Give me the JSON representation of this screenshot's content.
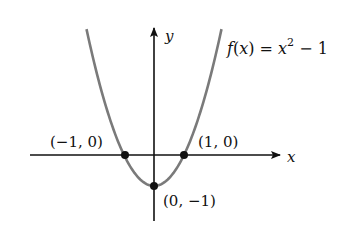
{
  "figure": {
    "function_label": {
      "f": "f",
      "open": "(",
      "var": "x",
      "close": ")",
      "eq": " = ",
      "base": "x",
      "exp": "2",
      "rest": " − 1"
    },
    "axis_labels": {
      "x": "x",
      "y": "y"
    },
    "points": [
      {
        "label": "(−1, 0)",
        "x": -1,
        "y": 0
      },
      {
        "label": "(1, 0)",
        "x": 1,
        "y": 0
      },
      {
        "label": "(0, −1)",
        "x": 0,
        "y": -1
      }
    ],
    "colors": {
      "curve": "#7a7a7a",
      "axes": "#111111",
      "points": "#111111"
    }
  },
  "chart_data": {
    "type": "line",
    "xlabel": "x",
    "ylabel": "y",
    "function": "x^2 - 1",
    "x": [
      -2.3,
      -2,
      -1.5,
      -1,
      -0.5,
      0,
      0.5,
      1,
      1.5,
      2,
      2.3
    ],
    "series": [
      {
        "name": "f(x) = x^2 − 1",
        "values": [
          4.29,
          3,
          1.25,
          0,
          -0.75,
          -1,
          -0.75,
          0,
          1.25,
          3,
          4.29
        ]
      }
    ],
    "annotations": [
      {
        "text": "(−1, 0)",
        "x": -1,
        "y": 0
      },
      {
        "text": "(1, 0)",
        "x": 1,
        "y": 0
      },
      {
        "text": "(0, −1)",
        "x": 0,
        "y": -1
      }
    ],
    "grid": false
  }
}
